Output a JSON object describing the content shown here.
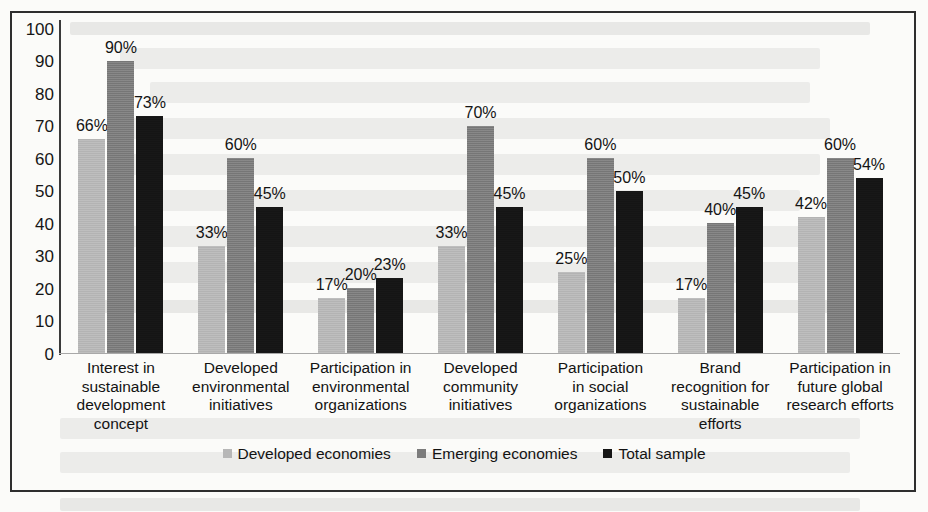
{
  "chart_data": {
    "type": "bar",
    "title": "",
    "xlabel": "",
    "ylabel": "",
    "ylim": [
      0,
      100
    ],
    "yticks": [
      100,
      90,
      80,
      70,
      60,
      50,
      40,
      30,
      20,
      10,
      0
    ],
    "grid": false,
    "legend_position": "bottom",
    "value_label_suffix": "%",
    "categories": [
      "Interest in sustainable development concept",
      "Developed environmental initiatives",
      "Participation in environmental organizations",
      "Developed community initiatives",
      "Participation in social organizations",
      "Brand recognition for sustainable efforts",
      "Participation in future global research efforts"
    ],
    "category_lines": [
      [
        "Interest in",
        "sustainable",
        "development",
        "concept"
      ],
      [
        "Developed",
        "environmental",
        "initiatives"
      ],
      [
        "Participation in",
        "environmental",
        "organizations"
      ],
      [
        "Developed",
        "community",
        "initiatives"
      ],
      [
        "Participation",
        "in social",
        "organizations"
      ],
      [
        "Brand",
        "recognition for",
        "sustainable",
        "efforts"
      ],
      [
        "Participation in",
        "future global",
        "research efforts"
      ]
    ],
    "series": [
      {
        "name": "Developed economies",
        "color": "#b7b7b7",
        "values": [
          66,
          33,
          17,
          33,
          25,
          17,
          42
        ],
        "labels": [
          "66%",
          "33%",
          "17%",
          "33%",
          "25%",
          "17%",
          "42%"
        ]
      },
      {
        "name": "Emerging economies",
        "color": "#7c7c7c",
        "values": [
          90,
          60,
          20,
          70,
          60,
          40,
          60
        ],
        "labels": [
          "90%",
          "60%",
          "20%",
          "70%",
          "60%",
          "40%",
          "60%"
        ]
      },
      {
        "name": "Total sample",
        "color": "#161616",
        "values": [
          73,
          45,
          23,
          45,
          50,
          45,
          54
        ],
        "labels": [
          "73%",
          "45%",
          "23%",
          "45%",
          "50%",
          "45%",
          "54%"
        ]
      }
    ]
  },
  "legend": {
    "items": [
      {
        "label": "Developed economies",
        "color": "#b7b7b7"
      },
      {
        "label": "Emerging economies",
        "color": "#7c7c7c"
      },
      {
        "label": "Total sample",
        "color": "#161616"
      }
    ]
  },
  "axis": {
    "y_tick_labels": [
      "100",
      "90",
      "80",
      "70",
      "60",
      "50",
      "40",
      "30",
      "20",
      "10",
      "0"
    ]
  }
}
